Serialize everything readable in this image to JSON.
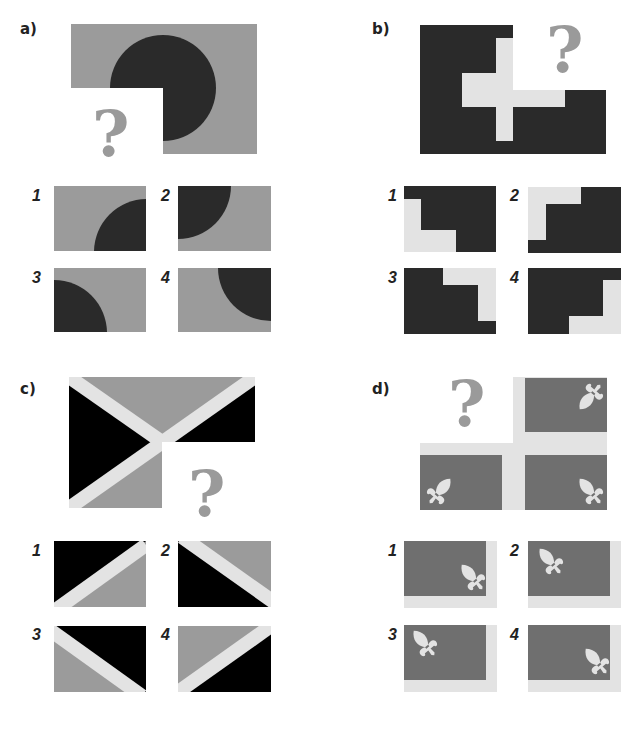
{
  "colors": {
    "gray": "#9b9b9b",
    "dark": "#2a2a2a",
    "black": "#000000",
    "light": "#e3e3e3",
    "flag_gray": "#6f6f6f",
    "question_mark": "#9a9a9a"
  },
  "puzzles": [
    {
      "id": "a",
      "label": "a)",
      "question_mark": "?",
      "description": "Gray rectangle with dark circle centered at missing bottom-left quadrant",
      "options": [
        {
          "number": "1",
          "description": "dark quarter circle in bottom-right corner"
        },
        {
          "number": "2",
          "description": "dark quarter circle in top-left corner"
        },
        {
          "number": "3",
          "description": "dark quarter circle in bottom-left corner"
        },
        {
          "number": "4",
          "description": "dark quarter circle in top-right corner"
        }
      ]
    },
    {
      "id": "b",
      "label": "b)",
      "question_mark": "?",
      "description": "Dark rectangle with light stepped cross shape, missing top-right quadrant",
      "options": [
        {
          "number": "1",
          "description": "dark with light step bottom-left"
        },
        {
          "number": "2",
          "description": "dark with light step top-left"
        },
        {
          "number": "3",
          "description": "dark with light step top-right"
        },
        {
          "number": "4",
          "description": "dark with light step bottom-right"
        }
      ]
    },
    {
      "id": "c",
      "label": "c)",
      "question_mark": "?",
      "description": "Rectangle split by light diagonal X band into black and gray triangles, missing bottom-right quadrant",
      "options": [
        {
          "number": "1",
          "description": "black top-left, gray bottom-right, band rising"
        },
        {
          "number": "2",
          "description": "gray top-right, black bottom-left, band falling"
        },
        {
          "number": "3",
          "description": "black top-right, gray bottom-left, band falling"
        },
        {
          "number": "4",
          "description": "gray top-left, black bottom-right, band rising"
        }
      ]
    },
    {
      "id": "d",
      "label": "d)",
      "question_mark": "?",
      "description": "Flag with light cross and four gray quadrants each containing a fleur-de-lis, missing top-left quadrant",
      "options": [
        {
          "number": "1",
          "description": "fleur-de-lis pointing down-right, band bottom and right"
        },
        {
          "number": "2",
          "description": "fleur-de-lis top-left pointing down-right, band bottom and right"
        },
        {
          "number": "3",
          "description": "fleur-de-lis top-left pointing up-left, band bottom and right"
        },
        {
          "number": "4",
          "description": "fleur-de-lis bottom-right pointing up-left, band bottom and right"
        }
      ]
    }
  ]
}
